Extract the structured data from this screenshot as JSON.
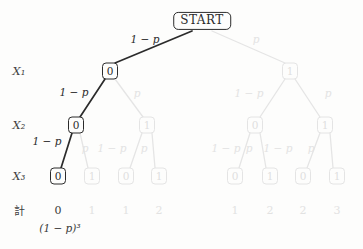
{
  "colors": {
    "active_path": "#2b2b2b",
    "faded_elements": "#e4e4e4",
    "background": "#fdfdfc"
  },
  "root": {
    "label": "START"
  },
  "rows": {
    "x1": "X₁",
    "x2": "X₂",
    "x3": "X₃",
    "total": "計"
  },
  "edge_labels": {
    "level1": [
      "1 − p",
      "p"
    ],
    "level2": [
      "1 − p",
      "p",
      "1 − p",
      "p"
    ],
    "level3": [
      "1 − p",
      "p",
      "1 − p",
      "p",
      "1 − p",
      "p",
      "1 − p",
      "p"
    ]
  },
  "nodes": {
    "x1": [
      {
        "value": "0",
        "state": "active"
      },
      {
        "value": "1",
        "state": "faded"
      }
    ],
    "x2": [
      {
        "value": "0",
        "state": "active"
      },
      {
        "value": "1",
        "state": "faded"
      },
      {
        "value": "0",
        "state": "faded"
      },
      {
        "value": "1",
        "state": "faded"
      }
    ],
    "x3": [
      {
        "value": "0",
        "state": "active"
      },
      {
        "value": "1",
        "state": "faded"
      },
      {
        "value": "0",
        "state": "faded"
      },
      {
        "value": "1",
        "state": "faded"
      },
      {
        "value": "0",
        "state": "faded"
      },
      {
        "value": "1",
        "state": "faded"
      },
      {
        "value": "0",
        "state": "faded"
      },
      {
        "value": "1",
        "state": "faded"
      }
    ]
  },
  "totals": {
    "values": [
      {
        "value": "0",
        "state": "active"
      },
      {
        "value": "1",
        "state": "faded"
      },
      {
        "value": "1",
        "state": "faded"
      },
      {
        "value": "2",
        "state": "faded"
      },
      {
        "value": "1",
        "state": "faded"
      },
      {
        "value": "2",
        "state": "faded"
      },
      {
        "value": "2",
        "state": "faded"
      },
      {
        "value": "3",
        "state": "faded"
      }
    ],
    "leftmost_path_probability": "(1 − p)³"
  }
}
